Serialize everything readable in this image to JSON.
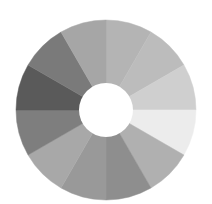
{
  "chart_data": {
    "type": "pie",
    "variant": "donut",
    "title": "",
    "legend": [],
    "center": [
      106,
      110
    ],
    "outer_radius": 90,
    "inner_radius": 27,
    "start_angle_deg": 0,
    "direction": "clockwise",
    "categories": [
      "S1",
      "S2",
      "S3",
      "S4",
      "S5",
      "S6",
      "S7",
      "S8",
      "S9",
      "S10",
      "S11",
      "S12"
    ],
    "values": [
      1,
      1,
      1,
      1,
      1,
      1,
      1,
      1,
      1,
      1,
      1,
      1
    ],
    "colors": [
      "#b4b4b4",
      "#bcbcbc",
      "#cfcfcf",
      "#ececec",
      "#b0b0b0",
      "#8e8e8e",
      "#999999",
      "#a8a8a8",
      "#7e7e7e",
      "#5a5a5a",
      "#7a7a7a",
      "#a6a6a6"
    ]
  }
}
